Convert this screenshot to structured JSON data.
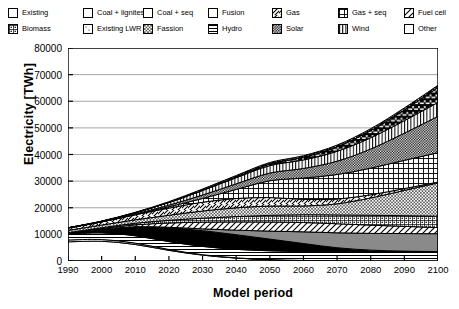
{
  "legend": {
    "columns": [
      {
        "x": 8,
        "items": [
          {
            "label": "Existing",
            "pattern": "solid-white"
          },
          {
            "label": "Biomass",
            "pattern": "biomass-grid-dots"
          }
        ]
      },
      {
        "x": 83,
        "items": [
          {
            "label": "Coal + lignites",
            "pattern": "solid-black"
          },
          {
            "label": "Existing LWR",
            "pattern": "sparse-dots"
          }
        ]
      },
      {
        "x": 143,
        "items": [
          {
            "label": "Coal + seq",
            "pattern": "solid-gray"
          },
          {
            "label": "Fassion",
            "pattern": "fine-checker"
          }
        ]
      },
      {
        "x": 208,
        "items": [
          {
            "label": "Fusion",
            "pattern": "black-blocks"
          },
          {
            "label": "Hydro",
            "pattern": "horizontal-lines"
          }
        ]
      },
      {
        "x": 272,
        "items": [
          {
            "label": "Gas",
            "pattern": "diagonal-hatch"
          },
          {
            "label": "Solar",
            "pattern": "dense-checker"
          }
        ]
      },
      {
        "x": 338,
        "items": [
          {
            "label": "Gas + seq",
            "pattern": "cross-grid"
          },
          {
            "label": "Wind",
            "pattern": "vertical-lines"
          }
        ]
      },
      {
        "x": 404,
        "items": [
          {
            "label": "Fuel cell",
            "pattern": "back-diagonal"
          },
          {
            "label": "Other",
            "pattern": "black-quad"
          }
        ]
      }
    ]
  },
  "chart_data": {
    "type": "area",
    "title": "",
    "xlabel": "Model period",
    "ylabel": "Electricity [TWh]",
    "xlim": [
      1990,
      2100
    ],
    "ylim": [
      0,
      80000
    ],
    "ytick_values": [
      0,
      10000,
      20000,
      30000,
      40000,
      50000,
      60000,
      70000,
      80000
    ],
    "ytick_labels": [
      "0",
      "10000",
      "20000",
      "30000",
      "40000",
      "50000",
      "60000",
      "70000",
      "80000"
    ],
    "xtick_values": [
      1990,
      2000,
      2010,
      2020,
      2030,
      2040,
      2050,
      2060,
      2070,
      2080,
      2090,
      2100
    ],
    "xtick_labels": [
      "1990",
      "2000",
      "2010",
      "2020",
      "2030",
      "2040",
      "2050",
      "2060",
      "2070",
      "2080",
      "2090",
      "2100"
    ],
    "grid": "horizontal",
    "legend_position": "above-plot",
    "stacked": true,
    "x": [
      1990,
      2000,
      2010,
      2020,
      2030,
      2040,
      2050,
      2060,
      2070,
      2080,
      2090,
      2100
    ],
    "series": [
      {
        "name": "Existing",
        "pattern": "solid-white",
        "values": [
          7200,
          7400,
          6200,
          4000,
          2200,
          1100,
          500,
          200,
          80,
          30,
          10,
          0
        ]
      },
      {
        "name": "Existing LWR",
        "pattern": "sparse-dots",
        "values": [
          700,
          650,
          520,
          330,
          180,
          80,
          30,
          10,
          5,
          0,
          0,
          0
        ]
      },
      {
        "name": "Hydro",
        "pattern": "horizontal-lines",
        "values": [
          2200,
          2500,
          2750,
          2950,
          3100,
          3200,
          3300,
          3350,
          3400,
          3450,
          3500,
          3550
        ]
      },
      {
        "name": "Coal + lignites",
        "pattern": "solid-black",
        "values": [
          300,
          1400,
          3400,
          5200,
          5900,
          5500,
          4400,
          3000,
          1500,
          600,
          200,
          0
        ]
      },
      {
        "name": "Coal + seq",
        "pattern": "solid-gray",
        "values": [
          0,
          0,
          0,
          200,
          700,
          1700,
          3000,
          4400,
          5600,
          6300,
          6600,
          6700
        ]
      },
      {
        "name": "Fuel cell",
        "pattern": "back-diagonal",
        "values": [
          100,
          250,
          700,
          1600,
          2500,
          3100,
          3400,
          3500,
          3400,
          3100,
          2700,
          2300
        ]
      },
      {
        "name": "Biomass",
        "pattern": "biomass-grid-dots",
        "values": [
          150,
          300,
          600,
          1000,
          1500,
          2000,
          2500,
          2900,
          3300,
          3700,
          4000,
          4300
        ]
      },
      {
        "name": "Fassion",
        "pattern": "fine-checker",
        "values": [
          850,
          1000,
          1300,
          1900,
          2700,
          3300,
          3500,
          3300,
          4200,
          6500,
          9500,
          12500
        ]
      },
      {
        "name": "Gas",
        "pattern": "diagonal-hatch",
        "values": [
          900,
          1200,
          1900,
          2700,
          3300,
          3500,
          3200,
          2500,
          1800,
          1200,
          700,
          300
        ]
      },
      {
        "name": "Gas + seq",
        "pattern": "cross-grid",
        "values": [
          0,
          0,
          100,
          500,
          1400,
          3400,
          6300,
          8000,
          9200,
          10000,
          10600,
          11000
        ]
      },
      {
        "name": "Solar",
        "pattern": "dense-checker",
        "values": [
          20,
          60,
          200,
          600,
          1300,
          2100,
          2900,
          3600,
          5000,
          7200,
          10200,
          13700
        ]
      },
      {
        "name": "Wind",
        "pattern": "vertical-lines",
        "values": [
          50,
          150,
          450,
          1000,
          1700,
          2300,
          2800,
          3200,
          3700,
          4200,
          4700,
          5200
        ]
      },
      {
        "name": "Fusion",
        "pattern": "black-blocks",
        "values": [
          0,
          0,
          0,
          0,
          100,
          300,
          600,
          1000,
          1700,
          2700,
          4000,
          5600
        ]
      },
      {
        "name": "Other",
        "pattern": "black-quad",
        "values": [
          30,
          90,
          180,
          320,
          450,
          520,
          570,
          600,
          650,
          720,
          790,
          850
        ]
      }
    ],
    "totals": [
      12500,
      15000,
      18300,
      22300,
      27000,
      32100,
      37000,
      39550,
      43500,
      49700,
      57500,
      66000
    ]
  }
}
